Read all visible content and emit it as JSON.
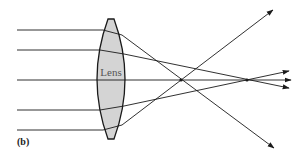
{
  "figure": {
    "panel_label": "(b)",
    "lens_label": "Lens",
    "colors": {
      "lens_fill": "#d4d4d4",
      "line": "#1a1a1a",
      "background": "#ffffff"
    }
  }
}
